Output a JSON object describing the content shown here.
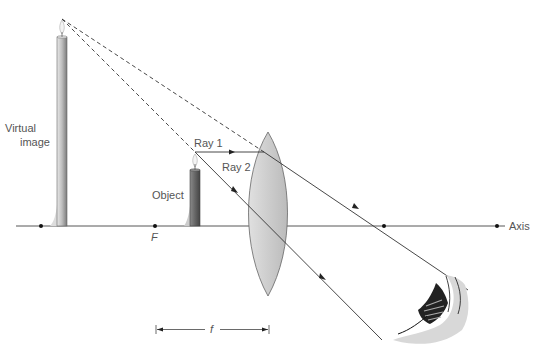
{
  "labels": {
    "virtual_image_line1": "Virtual",
    "virtual_image_line2": "image",
    "object": "Object",
    "ray1": "Ray 1",
    "ray2": "Ray 2",
    "focal_point": "F",
    "focal_length": "f",
    "axis": "Axis"
  },
  "colors": {
    "line": "#333333",
    "lens_fill": "#cfcfcf",
    "candle": "#9a9a9a",
    "text": "#555555"
  }
}
